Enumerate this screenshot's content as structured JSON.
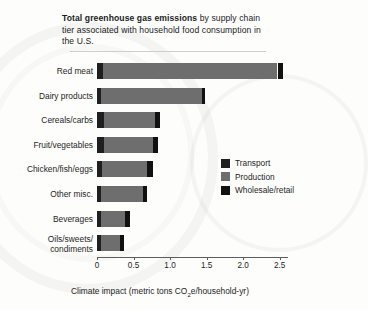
{
  "title": {
    "bold_part": "Total greenhouse gas emissions",
    "rest_line1": " by supply chain tier",
    "line2": "associated with household food consumption in the U.S."
  },
  "legend": {
    "items": [
      {
        "label": "Transport",
        "color": "#1f1f1f",
        "key": "transport"
      },
      {
        "label": "Production",
        "color": "#6e6e6e",
        "key": "production"
      },
      {
        "label": "Wholesale/retail",
        "color": "#111111",
        "key": "retail"
      }
    ]
  },
  "axis": {
    "x_title_main": "Climate impact (metric tons CO",
    "x_title_sub": "2",
    "x_title_tail": "e/household-yr)",
    "x_ticks": [
      "0",
      "0.5",
      "1.0",
      "1.5",
      "2.0",
      "2.5"
    ]
  },
  "chart_data": {
    "type": "bar",
    "orientation": "horizontal",
    "stacked": true,
    "title": "Total greenhouse gas emissions by supply chain tier associated with household food consumption in the U.S.",
    "xlabel": "Climate impact (metric tons CO2e/household-yr)",
    "ylabel": "",
    "xlim": [
      0,
      2.6
    ],
    "grid": false,
    "legend_position": "center-right",
    "categories": [
      "Red meat",
      "Dairy products",
      "Cereals/carbs",
      "Fruit/vegetables",
      "Chicken/fish/eggs",
      "Other misc.",
      "Beverages",
      "Oils/sweets/\ncondiments"
    ],
    "series": [
      {
        "name": "Transport",
        "color": "#1f1f1f",
        "values": [
          0.08,
          0.05,
          0.09,
          0.1,
          0.07,
          0.05,
          0.05,
          0.05
        ]
      },
      {
        "name": "Production",
        "color": "#6e6e6e",
        "values": [
          2.39,
          1.39,
          0.7,
          0.66,
          0.62,
          0.58,
          0.33,
          0.26
        ]
      },
      {
        "name": "Wholesale/retail",
        "color": "#111111",
        "values": [
          0.08,
          0.04,
          0.07,
          0.07,
          0.07,
          0.06,
          0.07,
          0.06
        ]
      }
    ],
    "totals": [
      2.55,
      1.48,
      0.86,
      0.83,
      0.76,
      0.69,
      0.45,
      0.37
    ]
  }
}
